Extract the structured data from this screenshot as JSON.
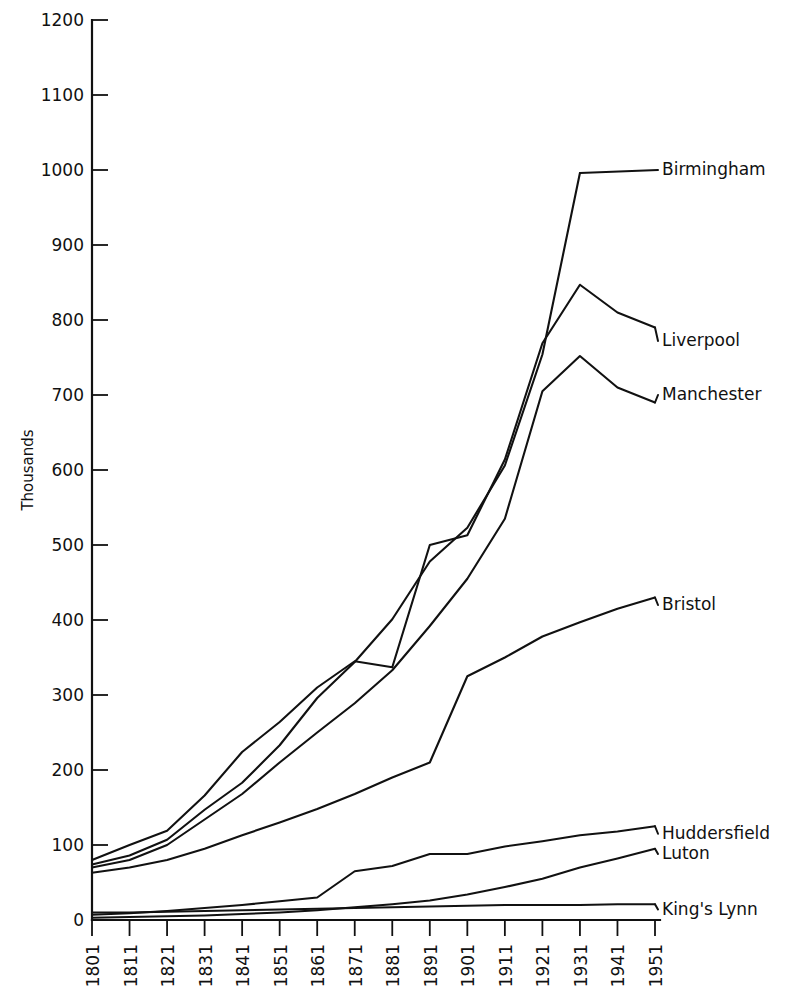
{
  "chart_data": {
    "type": "line",
    "title": "",
    "xlabel": "",
    "ylabel": "Thousands",
    "xlim": [
      1801,
      1951
    ],
    "ylim": [
      0,
      1200
    ],
    "grid": false,
    "legend_position": "right-inline-labels",
    "x": [
      1801,
      1811,
      1821,
      1831,
      1841,
      1851,
      1861,
      1871,
      1881,
      1891,
      1901,
      1911,
      1921,
      1931,
      1941,
      1951
    ],
    "categories": [
      "1801",
      "1811",
      "1821",
      "1831",
      "1841",
      "1851",
      "1861",
      "1871",
      "1881",
      "1891",
      "1901",
      "1911",
      "1921",
      "1931",
      "1941",
      "1951"
    ],
    "ytick_labels": [
      "0",
      "100",
      "200",
      "300",
      "400",
      "500",
      "600",
      "700",
      "800",
      "900",
      "1000",
      "1100",
      "1200"
    ],
    "ytick_values": [
      0,
      100,
      200,
      300,
      400,
      500,
      600,
      700,
      800,
      900,
      1000,
      1100,
      1200
    ],
    "series": [
      {
        "name": "Birmingham",
        "label": "Birmingham",
        "label_y": 1000,
        "values": [
          74,
          86,
          107,
          147,
          183,
          233,
          296,
          344,
          401,
          478,
          523,
          606,
          754,
          996,
          996,
          996
        ]
      },
      {
        "name": "Liverpool",
        "label": "Liverpool",
        "label_y": 772,
        "values": [
          80,
          100,
          119,
          166,
          224,
          264,
          310,
          345,
          337,
          500,
          513,
          614,
          769,
          847,
          810,
          790
        ]
      },
      {
        "name": "Manchester",
        "label": "Manchester",
        "label_y": 700,
        "values": [
          70,
          80,
          100,
          134,
          168,
          210,
          250,
          289,
          333,
          392,
          455,
          535,
          705,
          752,
          710,
          690
        ]
      },
      {
        "name": "Bristol",
        "label": "Bristol",
        "label_y": 420,
        "values": [
          63,
          70,
          80,
          95,
          113,
          130,
          148,
          168,
          190,
          210,
          325,
          350,
          378,
          397,
          415,
          430
        ]
      },
      {
        "name": "Huddersfield",
        "label": "Huddersfield",
        "label_y": 115,
        "values": [
          7,
          9,
          12,
          16,
          20,
          25,
          30,
          65,
          72,
          88,
          88,
          98,
          105,
          113,
          118,
          125
        ]
      },
      {
        "name": "Luton",
        "label": "Luton",
        "label_y": 88,
        "values": [
          3,
          4,
          5,
          6,
          8,
          10,
          13,
          17,
          21,
          26,
          34,
          44,
          55,
          70,
          82,
          95
        ]
      },
      {
        "name": "King's Lynn",
        "label": "King's Lynn",
        "label_y": 14,
        "values": [
          10,
          10,
          11,
          12,
          13,
          14,
          15,
          16,
          17,
          18,
          19,
          20,
          20,
          20,
          21,
          21
        ]
      }
    ]
  },
  "axis": {
    "y_axis_title": "Thousands"
  },
  "colors": {
    "ink": "#111111",
    "background": "#ffffff"
  }
}
